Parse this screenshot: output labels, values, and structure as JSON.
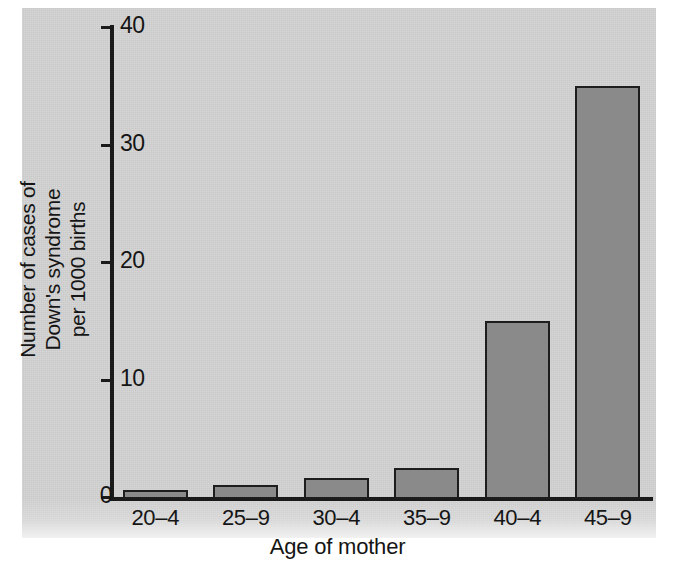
{
  "figure": {
    "background_color": "#d2d2d2",
    "page_color": "#ffffff",
    "ink_color": "#151515",
    "bar_fill_color": "#8a8a8a",
    "bar_edge_color": "#1d1d1d"
  },
  "chart_data": {
    "type": "bar",
    "title": "",
    "subtitle": "",
    "xlabel": "Age of mother",
    "ylabel": "Number of cases of\nDown's syndrome\nper 1000 births",
    "categories": [
      "20–4",
      "25–9",
      "30–4",
      "35–9",
      "40–4",
      "45–9"
    ],
    "values": [
      0.6,
      1.0,
      1.6,
      2.5,
      15.0,
      35.0
    ],
    "ylim": [
      0,
      40
    ],
    "yticks": [
      0,
      10,
      20,
      30,
      40
    ],
    "ytick_labels": [
      "0",
      "10",
      "20",
      "30",
      "40"
    ],
    "grid": false,
    "legend": false,
    "legend_position": "none",
    "series": [
      {
        "name": "Down's syndrome cases per 1000 births",
        "values": [
          0.6,
          1.0,
          1.6,
          2.5,
          15.0,
          35.0
        ]
      }
    ],
    "annotations": []
  },
  "axis": {
    "y_title_line1": "Number of cases of",
    "y_title_line2": "Down's syndrome",
    "y_title_line3": "per 1000 births",
    "x_title": "Age of mother"
  }
}
